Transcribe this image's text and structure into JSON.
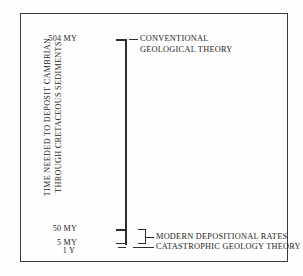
{
  "figure": {
    "axis_title_line1": "TIME NEEDED TO DEPOSIT CAMBRIAN",
    "axis_title_line2": "THROUGH CRETACEOUS SEDIMENTS",
    "frame_color": "#3b3b3b",
    "line_color": "#2e2e2e",
    "background": "#fefefe"
  },
  "ticks": {
    "t504": "504 MY",
    "t50": "50 MY",
    "t5": "5 MY",
    "t1y": "1 Y"
  },
  "captions": {
    "conventional_line1": "CONVENTIONAL",
    "conventional_line2": "GEOLOGICAL THEORY",
    "modern": "MODERN DEPOSITIONAL RATES",
    "catastrophic": "CATASTROPHIC GEOLOGY THEORY"
  },
  "chart_data": {
    "type": "bar",
    "title": "",
    "subtitle": "",
    "orientation": "vertical-axis-scale",
    "xlabel": "",
    "ylabel": "TIME NEEDED TO DEPOSIT CAMBRIAN THROUGH CRETACEOUS SEDIMENTS",
    "axis_scale": "nonlinear",
    "grid": false,
    "legend": "none",
    "tick_labels": [
      "504 MY",
      "50 MY",
      "5 MY",
      "1 Y"
    ],
    "tick_values": [
      504000000,
      50000000,
      5000000,
      1
    ],
    "tick_units": [
      "million years",
      "million years",
      "million years",
      "year"
    ],
    "categories": [
      "CONVENTIONAL GEOLOGICAL THEORY",
      "MODERN DEPOSITIONAL RATES",
      "CATASTROPHIC GEOLOGY THEORY"
    ],
    "values": [
      504000000,
      27500000,
      1
    ],
    "annotations": [
      {
        "label": "CONVENTIONAL GEOLOGICAL THEORY",
        "tick": "504 MY",
        "value": 504000000,
        "units": "years"
      },
      {
        "label": "MODERN DEPOSITIONAL RATES",
        "range_from": "5 MY",
        "range_to": "50 MY",
        "value_from": 5000000,
        "value_to": 50000000,
        "units": "years",
        "marker": "bracket"
      },
      {
        "label": "CATASTROPHIC GEOLOGY THEORY",
        "tick": "1 Y",
        "value": 1,
        "units": "years"
      }
    ]
  }
}
